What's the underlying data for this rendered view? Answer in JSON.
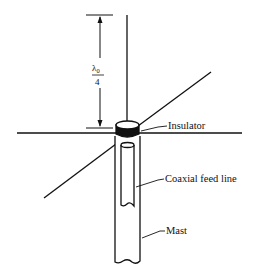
{
  "diagram": {
    "type": "ground-plane monopole antenna",
    "dimension": {
      "symbol": "λ",
      "subscript": "0",
      "denominator": "4"
    },
    "labels": {
      "insulator": "Insulator",
      "coax": "Coaxial feed line",
      "mast": "Mast"
    },
    "colors": {
      "stroke": "#111111",
      "background": "#ffffff"
    }
  }
}
